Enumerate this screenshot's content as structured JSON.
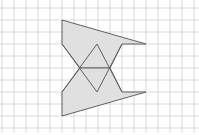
{
  "figure": {
    "grid": {
      "spacing": 12,
      "origin_x": 2,
      "origin_y": 8,
      "cols": 16,
      "rows": 10,
      "line_color": "#d0d0d0"
    },
    "shape": {
      "fill_color": "#e0e0e0",
      "stroke_color": "#606060",
      "top_part": [
        [
          62,
          20
        ],
        [
          146,
          44
        ],
        [
          122,
          44
        ],
        [
          110,
          68
        ],
        [
          80,
          68
        ],
        [
          62,
          44
        ]
      ],
      "bottom_part": [
        [
          62,
          116
        ],
        [
          146,
          92
        ],
        [
          122,
          92
        ],
        [
          110,
          68
        ],
        [
          80,
          68
        ],
        [
          62,
          92
        ]
      ],
      "diamond": [
        [
          97,
          44
        ],
        [
          110,
          68
        ],
        [
          97,
          92
        ],
        [
          80,
          68
        ]
      ],
      "crossing_lines": [
        [
          [
            62,
            44
          ],
          [
            97,
            92
          ]
        ],
        [
          [
            62,
            92
          ],
          [
            97,
            44
          ]
        ],
        [
          [
            97,
            44
          ],
          [
            122,
            92
          ]
        ],
        [
          [
            97,
            92
          ],
          [
            122,
            44
          ]
        ]
      ]
    }
  }
}
